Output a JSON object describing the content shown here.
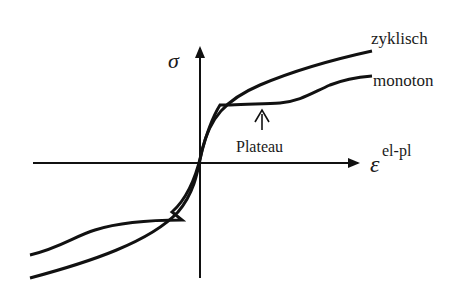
{
  "diagram": {
    "type": "stress-strain sketch",
    "axes": {
      "y_label": "σ",
      "x_label_base": "ε",
      "x_label_sup": "el-pl"
    },
    "curves": [
      {
        "name": "zyklisch",
        "label": "zyklisch"
      },
      {
        "name": "monoton",
        "label": "monoton"
      }
    ],
    "annotation": {
      "label": "Plateau"
    },
    "colors": {
      "line": "#111111",
      "background": "#ffffff"
    }
  }
}
